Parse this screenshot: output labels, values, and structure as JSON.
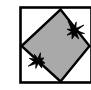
{
  "figure": {
    "kind": "technical-illustration",
    "canvas": {
      "width": 91,
      "height": 90
    },
    "colors": {
      "page_background": "#ffffff",
      "frame_stroke": "#000000",
      "frame_fill": "#ffffff",
      "diamond_fill": "#a9a9a9",
      "diamond_stroke": "#000000",
      "burst_fill": "#000000"
    },
    "frame": {
      "label": "outer-square-frame",
      "x": 20.5,
      "y": 7.5,
      "width": 71,
      "height": 75,
      "stroke_width": 2.6
    },
    "diamond": {
      "label": "gray-diamond",
      "points": "60.5,9.5 89.5,46 60.5,81.5 21.5,46",
      "stroke_width": 2.4,
      "rotation_deg": 45
    },
    "bursts": [
      {
        "label": "burst-upper-right",
        "center_x": 74,
        "center_y": 31,
        "radius_outer": 10.5,
        "radius_inner": 3.4,
        "spikes": 8,
        "rotation_deg": 14
      },
      {
        "label": "burst-lower-left",
        "center_x": 38,
        "center_y": 61,
        "radius_outer": 10.0,
        "radius_inner": 3.2,
        "spikes": 8,
        "rotation_deg": -28
      }
    ]
  }
}
